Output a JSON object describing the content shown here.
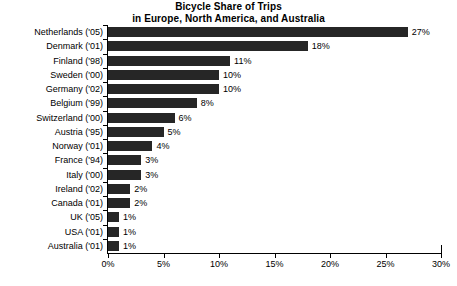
{
  "chart_data": {
    "type": "bar",
    "orientation": "horizontal",
    "title": "Bicycle Share of Trips in Europe, North America, and Australia",
    "title_lines": [
      "Bicycle Share of Trips",
      "in Europe, North America, and Australia"
    ],
    "xlabel": "",
    "ylabel": "",
    "xlim": [
      0,
      30
    ],
    "xticks": [
      0,
      5,
      10,
      15,
      20,
      25,
      30
    ],
    "xtick_labels": [
      "0%",
      "5%",
      "10%",
      "15%",
      "20%",
      "25%",
      "30%"
    ],
    "grid": false,
    "legend": false,
    "bar_color": "#262626",
    "axis_color": "#000000",
    "value_label_suffix": "%",
    "categories": [
      "Netherlands ('05)",
      "Denmark ('01)",
      "Finland ('98)",
      "Sweden ('00)",
      "Germany ('02)",
      "Belgium ('99)",
      "Switzerland ('00)",
      "Austria ('95)",
      "Norway ('01)",
      "France ('94)",
      "Italy ('00)",
      "Ireland ('02)",
      "Canada ('01)",
      "UK ('05)",
      "USA ('01)",
      "Australia ('01)"
    ],
    "values": [
      27,
      18,
      11,
      10,
      10,
      8,
      6,
      5,
      4,
      3,
      3,
      2,
      2,
      1,
      1,
      1
    ],
    "value_labels": [
      "27%",
      "18%",
      "11%",
      "10%",
      "10%",
      "8%",
      "6%",
      "5%",
      "4%",
      "3%",
      "3%",
      "2%",
      "2%",
      "1%",
      "1%",
      "1%"
    ]
  }
}
